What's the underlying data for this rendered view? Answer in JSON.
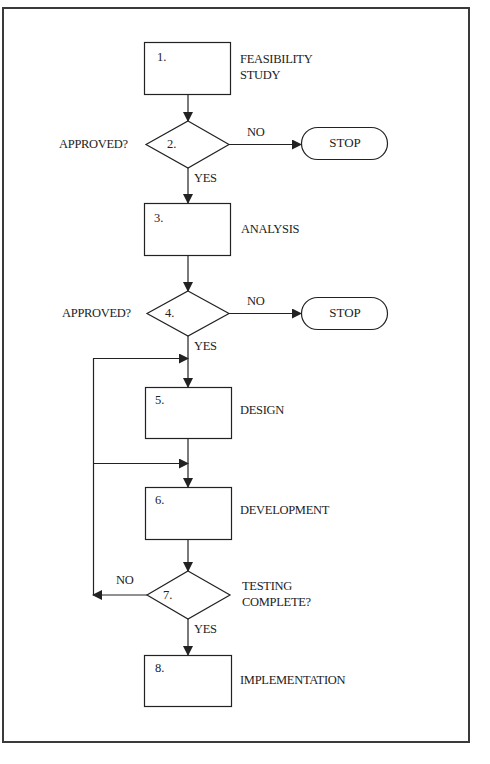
{
  "diagram": {
    "type": "flowchart",
    "steps": [
      {
        "id": "1",
        "number": "1.",
        "shape": "process",
        "label_line1": "FEASIBILITY",
        "label_line2": "STUDY"
      },
      {
        "id": "2",
        "number": "2.",
        "shape": "decision",
        "label": "APPROVED?",
        "no": "NO",
        "yes": "YES",
        "no_target": "STOP"
      },
      {
        "id": "3",
        "number": "3.",
        "shape": "process",
        "label": "ANALYSIS"
      },
      {
        "id": "4",
        "number": "4.",
        "shape": "decision",
        "label": "APPROVED?",
        "no": "NO",
        "yes": "YES",
        "no_target": "STOP"
      },
      {
        "id": "5",
        "number": "5.",
        "shape": "process",
        "label": "DESIGN"
      },
      {
        "id": "6",
        "number": "6.",
        "shape": "process",
        "label": "DEVELOPMENT"
      },
      {
        "id": "7",
        "number": "7.",
        "shape": "decision",
        "label_line1": "TESTING",
        "label_line2": "COMPLETE?",
        "no": "NO",
        "yes": "YES"
      },
      {
        "id": "8",
        "number": "8.",
        "shape": "process",
        "label": "IMPLEMENTATION"
      }
    ],
    "terminals": [
      {
        "id": "stop1",
        "label": "STOP"
      },
      {
        "id": "stop2",
        "label": "STOP"
      }
    ],
    "edges": [
      {
        "from": "1",
        "to": "2"
      },
      {
        "from": "2",
        "to": "stop1",
        "label": "NO"
      },
      {
        "from": "2",
        "to": "3",
        "label": "YES"
      },
      {
        "from": "3",
        "to": "4"
      },
      {
        "from": "4",
        "to": "stop2",
        "label": "NO"
      },
      {
        "from": "4",
        "to": "5",
        "label": "YES"
      },
      {
        "from": "5",
        "to": "6"
      },
      {
        "from": "6",
        "to": "7"
      },
      {
        "from": "7",
        "to": "5",
        "label": "NO",
        "note": "loop back to before design"
      },
      {
        "from": "7",
        "to": "6",
        "label": "NO",
        "note": "loop back to before development"
      },
      {
        "from": "7",
        "to": "8",
        "label": "YES"
      }
    ],
    "colors": {
      "line": "#222222",
      "frame": "#3a3a3a",
      "background": "#ffffff"
    }
  }
}
